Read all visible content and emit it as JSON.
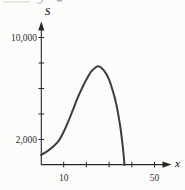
{
  "figure": {
    "kind": "textbook-curve-graph"
  },
  "colors": {
    "background": "#fcfcfa",
    "axis": "#262626",
    "curve": "#3d3d3d",
    "text": "#2e2e2e",
    "artifact": "#b3b3ac"
  },
  "chart_data": {
    "type": "line",
    "title": "",
    "xlabel": "x",
    "ylabel": "S",
    "xlim": [
      0,
      55
    ],
    "ylim": [
      0,
      11000
    ],
    "grid": false,
    "x_ticks": [
      10,
      20,
      30,
      40,
      50
    ],
    "x_tick_labels": {
      "10": "10",
      "50": "50"
    },
    "y_ticks": [
      2000,
      4000,
      6000,
      8000,
      10000
    ],
    "y_tick_labels": {
      "2000": "2,000",
      "10000": "10,000"
    },
    "series": [
      {
        "name": "S versus x curve",
        "points": [
          [
            0,
            800
          ],
          [
            2,
            1000
          ],
          [
            4,
            1250
          ],
          [
            6,
            1550
          ],
          [
            8,
            1950
          ],
          [
            10,
            2600
          ],
          [
            12,
            3400
          ],
          [
            14,
            4300
          ],
          [
            16,
            5200
          ],
          [
            18,
            6000
          ],
          [
            20,
            6700
          ],
          [
            22,
            7300
          ],
          [
            24,
            7650
          ],
          [
            25,
            7750
          ],
          [
            26,
            7700
          ],
          [
            28,
            7350
          ],
          [
            30,
            6700
          ],
          [
            32,
            5600
          ],
          [
            33,
            4900
          ],
          [
            34,
            4000
          ],
          [
            35,
            2900
          ],
          [
            36,
            1500
          ],
          [
            36.8,
            0
          ]
        ]
      }
    ],
    "annotations": {
      "peak_approx": [
        25,
        7750
      ],
      "x_intercept_approx": 36.8,
      "y_start_approx": 800
    }
  }
}
